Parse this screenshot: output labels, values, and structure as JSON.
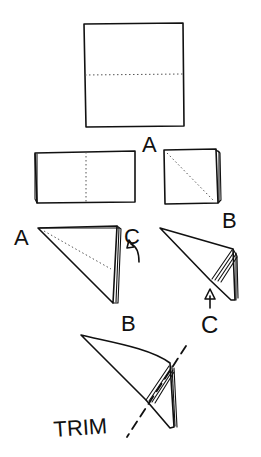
{
  "diagram": {
    "type": "folding-instructions",
    "steps": [
      {
        "id": 1,
        "description": "square sheet with horizontal dotted fold line",
        "label": "A"
      },
      {
        "id": 2,
        "description": "folded rectangle with vertical dotted fold line"
      },
      {
        "id": 3,
        "description": "folded square with diagonal dotted fold line",
        "label": "B"
      },
      {
        "id": 4,
        "description": "triangle with corners labeled",
        "labels": [
          "A",
          "C",
          "B"
        ],
        "arrow": "curved-up"
      },
      {
        "id": 5,
        "description": "rolled cone with arrow pointing up",
        "label": "C",
        "arrow": "up"
      },
      {
        "id": 6,
        "description": "cone with dashed trim line",
        "label": "TRIM"
      }
    ],
    "labels": {
      "step1_a": "A",
      "step3_b": "B",
      "step4_a": "A",
      "step4_c": "C",
      "step4_b": "B",
      "step5_c": "C",
      "trim": "TRIM"
    },
    "colors": {
      "ink": "#111111",
      "background": "#ffffff"
    }
  }
}
